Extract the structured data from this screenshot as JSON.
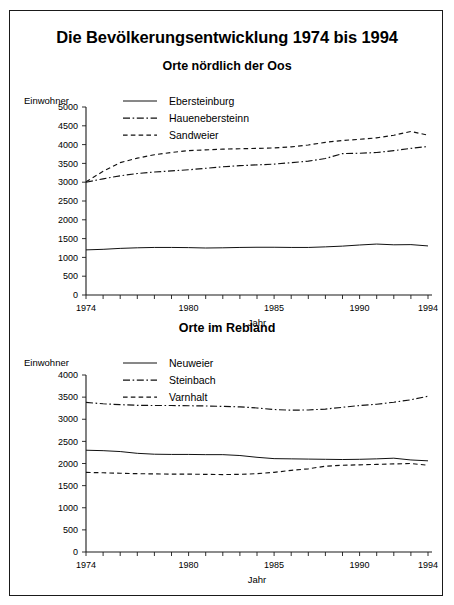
{
  "title": "Die Bevölkerungsentwicklung 1974 bis 1994",
  "charts": [
    {
      "panel_title": "Orte nördlich der Oos",
      "ylabel": "Einwohner",
      "xlabel": "Jahr",
      "legend": [
        {
          "label": "Ebersteinburg",
          "style": "solid"
        },
        {
          "label": "Hauenebersteinn",
          "style": "dashdot"
        },
        {
          "label": "Sandweier",
          "style": "dashed"
        }
      ],
      "chart_data": {
        "type": "line",
        "title": "Orte nördlich der Oos",
        "xlabel": "Jahr",
        "ylabel": "Einwohner",
        "xlim": [
          1974,
          1994
        ],
        "ylim": [
          0,
          5000
        ],
        "yticks": [
          0,
          500,
          1000,
          1500,
          2000,
          2500,
          3000,
          3500,
          4000,
          4500,
          5000
        ],
        "xticks": [
          1974,
          1975,
          1976,
          1977,
          1978,
          1979,
          1980,
          1981,
          1982,
          1983,
          1984,
          1985,
          1986,
          1987,
          1988,
          1989,
          1990,
          1991,
          1992,
          1993,
          1994
        ],
        "xtick_labels": {
          "1974": "1974",
          "1980": "1980",
          "1985": "1985",
          "1990": "1990",
          "1994": "1994"
        },
        "grid": false,
        "legend_position": "top-center",
        "x": [
          1974,
          1975,
          1976,
          1977,
          1978,
          1979,
          1980,
          1981,
          1982,
          1983,
          1984,
          1985,
          1986,
          1987,
          1988,
          1989,
          1990,
          1991,
          1992,
          1993,
          1994
        ],
        "series": [
          {
            "name": "Ebersteinburg",
            "style": "solid",
            "values": [
              1200,
              1215,
              1240,
              1255,
              1265,
              1265,
              1260,
              1250,
              1255,
              1265,
              1270,
              1270,
              1265,
              1265,
              1280,
              1300,
              1330,
              1355,
              1335,
              1340,
              1305
            ]
          },
          {
            "name": "Hauenebersteinn",
            "style": "dashdot",
            "values": [
              3000,
              3090,
              3170,
              3230,
              3270,
              3300,
              3330,
              3370,
              3410,
              3440,
              3460,
              3480,
              3520,
              3560,
              3630,
              3760,
              3770,
              3790,
              3840,
              3900,
              3950
            ]
          },
          {
            "name": "Sandweier",
            "style": "dashed",
            "values": [
              3010,
              3290,
              3520,
              3640,
              3730,
              3790,
              3840,
              3860,
              3880,
              3890,
              3900,
              3910,
              3940,
              3990,
              4060,
              4110,
              4140,
              4180,
              4250,
              4350,
              4250
            ]
          }
        ]
      }
    },
    {
      "panel_title": "Orte im Rebland",
      "ylabel": "Einwohner",
      "xlabel": "Jahr",
      "legend": [
        {
          "label": "Neuweier",
          "style": "solid"
        },
        {
          "label": "Steinbach",
          "style": "dashdot"
        },
        {
          "label": "Varnhalt",
          "style": "dashed"
        }
      ],
      "chart_data": {
        "type": "line",
        "title": "Orte im Rebland",
        "xlabel": "Jahr",
        "ylabel": "Einwohner",
        "xlim": [
          1974,
          1994
        ],
        "ylim": [
          0,
          4000
        ],
        "yticks": [
          0,
          500,
          1000,
          1500,
          2000,
          2500,
          3000,
          3500,
          4000
        ],
        "xticks": [
          1974,
          1975,
          1976,
          1977,
          1978,
          1979,
          1980,
          1981,
          1982,
          1983,
          1984,
          1985,
          1986,
          1987,
          1988,
          1989,
          1990,
          1991,
          1992,
          1993,
          1994
        ],
        "xtick_labels": {
          "1974": "1974",
          "1980": "1980",
          "1985": "1985",
          "1990": "1990",
          "1994": "1994"
        },
        "grid": false,
        "legend_position": "top-center",
        "x": [
          1974,
          1975,
          1976,
          1977,
          1978,
          1979,
          1980,
          1981,
          1982,
          1983,
          1984,
          1985,
          1986,
          1987,
          1988,
          1989,
          1990,
          1991,
          1992,
          1993,
          1994
        ],
        "series": [
          {
            "name": "Neuweier",
            "style": "solid",
            "values": [
              2300,
              2290,
              2270,
              2230,
              2210,
              2205,
              2205,
              2200,
              2200,
              2180,
              2140,
              2110,
              2105,
              2100,
              2095,
              2090,
              2095,
              2105,
              2120,
              2080,
              2060
            ]
          },
          {
            "name": "Steinbach",
            "style": "dashdot",
            "values": [
              3380,
              3350,
              3330,
              3315,
              3310,
              3310,
              3305,
              3300,
              3290,
              3280,
              3255,
              3220,
              3205,
              3210,
              3230,
              3270,
              3310,
              3340,
              3385,
              3440,
              3520
            ]
          },
          {
            "name": "Varnhalt",
            "style": "dashed",
            "values": [
              1800,
              1790,
              1780,
              1770,
              1765,
              1760,
              1760,
              1755,
              1750,
              1755,
              1770,
              1800,
              1845,
              1880,
              1940,
              1960,
              1970,
              1980,
              1990,
              2000,
              1960
            ]
          }
        ]
      }
    }
  ]
}
